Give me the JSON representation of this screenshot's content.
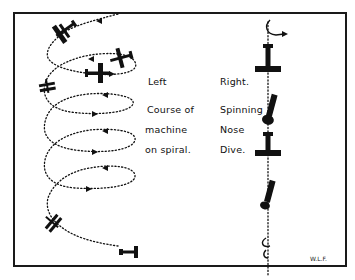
{
  "figure": {
    "left_caption": [
      "Left",
      "Course of",
      "machine",
      "on spiral."
    ],
    "right_caption": [
      "Right.",
      "Spinning",
      "Nose",
      "Dive."
    ],
    "signature": "W.L.F."
  },
  "colors": {
    "ink": "#111111",
    "paper": "#ffffff"
  }
}
